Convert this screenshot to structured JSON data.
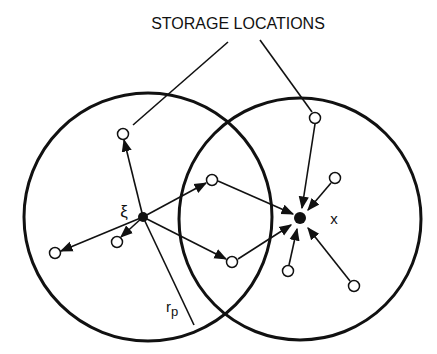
{
  "title": "STORAGE LOCATIONS",
  "labels": {
    "xi": "ξ",
    "x": "x",
    "r": "r",
    "p": "p"
  },
  "colors": {
    "stroke": "#111111",
    "background": "#ffffff"
  },
  "circles": [
    {
      "name": "left-circle",
      "cx": 148,
      "cy": 217,
      "r": 124
    },
    {
      "name": "right-circle",
      "cx": 300,
      "cy": 219,
      "r": 121
    }
  ],
  "nodes": {
    "xi": {
      "x": 143,
      "y": 217
    },
    "x": {
      "x": 300,
      "y": 218
    },
    "storage": [
      {
        "x": 123,
        "y": 134
      },
      {
        "x": 212,
        "y": 180
      },
      {
        "x": 55,
        "y": 253
      },
      {
        "x": 117,
        "y": 242
      },
      {
        "x": 232,
        "y": 262
      },
      {
        "x": 315,
        "y": 118
      },
      {
        "x": 335,
        "y": 178
      },
      {
        "x": 288,
        "y": 271
      },
      {
        "x": 354,
        "y": 286
      }
    ]
  }
}
